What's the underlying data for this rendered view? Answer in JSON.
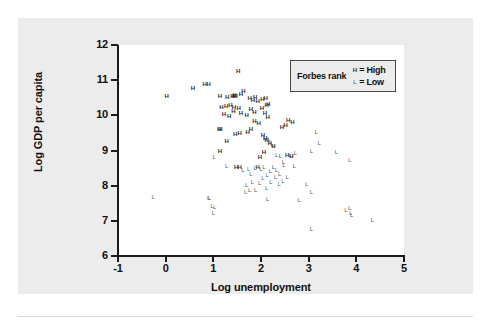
{
  "figure": {
    "background_color": "#ececec",
    "plot_background_color": "#ffffff",
    "axis_color": "#1b1b1b"
  },
  "legend": {
    "title": "Forbes rank",
    "entries": [
      {
        "marker": "H",
        "equals": "=",
        "label": "High",
        "key": "high"
      },
      {
        "marker": "L",
        "equals": "=",
        "label": "Low",
        "key": "low"
      }
    ]
  },
  "chart_data": {
    "type": "scatter",
    "title": "",
    "xlabel": "Log unemployment",
    "ylabel": "Log GDP per capita",
    "xlim": [
      -1,
      5
    ],
    "ylim": [
      6,
      12
    ],
    "xticks": [
      -1,
      0,
      1,
      2,
      3,
      4,
      5
    ],
    "yticks": [
      6,
      7,
      8,
      9,
      10,
      11,
      12
    ],
    "xtick_labels": [
      "-1",
      "0",
      "1",
      "2",
      "3",
      "4",
      "5"
    ],
    "ytick_labels": [
      "6",
      "7",
      "8",
      "9",
      "10",
      "11",
      "12"
    ],
    "grid": false,
    "legend_position": "top-right",
    "series": [
      {
        "name": "High",
        "marker": "H",
        "points": [
          [
            0.02,
            10.56
          ],
          [
            0.57,
            10.78
          ],
          [
            0.82,
            10.88
          ],
          [
            0.9,
            10.89
          ],
          [
            1.14,
            10.56
          ],
          [
            1.29,
            10.52
          ],
          [
            1.4,
            10.55
          ],
          [
            1.43,
            10.56
          ],
          [
            1.45,
            10.58
          ],
          [
            1.47,
            10.54
          ],
          [
            1.52,
            11.26
          ],
          [
            1.58,
            10.62
          ],
          [
            1.63,
            10.7
          ],
          [
            1.17,
            10.23
          ],
          [
            1.27,
            10.27
          ],
          [
            1.36,
            10.3
          ],
          [
            1.43,
            10.24
          ],
          [
            1.53,
            10.21
          ],
          [
            1.76,
            10.48
          ],
          [
            1.83,
            10.44
          ],
          [
            1.88,
            10.52
          ],
          [
            1.93,
            10.42
          ],
          [
            2.03,
            10.47
          ],
          [
            2.1,
            10.5
          ],
          [
            2.12,
            10.3
          ],
          [
            2.15,
            10.31
          ],
          [
            1.12,
            9.62
          ],
          [
            1.22,
            10.05
          ],
          [
            1.33,
            9.97
          ],
          [
            1.42,
            10.12
          ],
          [
            1.58,
            10.07
          ],
          [
            1.7,
            10.0
          ],
          [
            1.79,
            10.19
          ],
          [
            1.86,
            10.1
          ],
          [
            2.02,
            10.22
          ],
          [
            2.08,
            10.07
          ],
          [
            2.14,
            9.96
          ],
          [
            1.15,
            9.6
          ],
          [
            1.28,
            9.27
          ],
          [
            1.46,
            9.47
          ],
          [
            1.55,
            9.49
          ],
          [
            1.72,
            9.52
          ],
          [
            1.79,
            9.6
          ],
          [
            1.86,
            9.84
          ],
          [
            1.95,
            9.79
          ],
          [
            2.04,
            9.43
          ],
          [
            2.09,
            9.35
          ],
          [
            2.12,
            9.3
          ],
          [
            2.18,
            9.22
          ],
          [
            2.26,
            9.12
          ],
          [
            2.44,
            9.67
          ],
          [
            2.52,
            9.72
          ],
          [
            2.57,
            9.86
          ],
          [
            2.66,
            9.8
          ],
          [
            1.98,
            8.82
          ],
          [
            2.06,
            8.96
          ],
          [
            1.14,
            8.98
          ],
          [
            1.48,
            8.52
          ],
          [
            2.55,
            8.88
          ],
          [
            2.64,
            8.83
          ],
          [
            1.55,
            8.54
          ],
          [
            1.93,
            8.54
          ]
        ]
      },
      {
        "name": "Low",
        "marker": "L",
        "points": [
          [
            1.02,
            8.82
          ],
          [
            1.28,
            8.57
          ],
          [
            2.08,
            9.36
          ],
          [
            2.16,
            9.34
          ],
          [
            2.19,
            9.25
          ],
          [
            2.23,
            9.18
          ],
          [
            2.26,
            9.14
          ],
          [
            2.33,
            8.86
          ],
          [
            2.41,
            8.84
          ],
          [
            2.62,
            8.85
          ],
          [
            2.72,
            8.92
          ],
          [
            3.16,
            9.54
          ],
          [
            3.22,
            9.22
          ],
          [
            3.58,
            8.97
          ],
          [
            3.86,
            8.72
          ],
          [
            3.06,
            9.0
          ],
          [
            1.62,
            8.44
          ],
          [
            1.74,
            8.48
          ],
          [
            1.79,
            8.34
          ],
          [
            1.88,
            8.5
          ],
          [
            2.0,
            8.47
          ],
          [
            2.06,
            8.54
          ],
          [
            2.13,
            8.3
          ],
          [
            2.2,
            8.42
          ],
          [
            2.26,
            8.52
          ],
          [
            2.33,
            8.45
          ],
          [
            2.39,
            8.32
          ],
          [
            2.48,
            8.58
          ],
          [
            2.55,
            8.26
          ],
          [
            1.7,
            8.02
          ],
          [
            1.82,
            8.1
          ],
          [
            1.89,
            7.88
          ],
          [
            1.97,
            8.08
          ],
          [
            2.04,
            8.22
          ],
          [
            2.12,
            7.94
          ],
          [
            2.21,
            8.1
          ],
          [
            2.3,
            8.24
          ],
          [
            2.38,
            8.04
          ],
          [
            2.46,
            8.14
          ],
          [
            1.68,
            7.82
          ],
          [
            1.76,
            7.88
          ],
          [
            2.96,
            8.04
          ],
          [
            3.06,
            7.82
          ],
          [
            2.8,
            7.58
          ],
          [
            0.9,
            7.64
          ],
          [
            -0.26,
            7.68
          ],
          [
            0.92,
            7.66
          ],
          [
            0.97,
            7.42
          ],
          [
            1.03,
            7.38
          ],
          [
            1.0,
            7.22
          ],
          [
            3.06,
            6.76
          ],
          [
            3.78,
            7.32
          ],
          [
            3.86,
            7.36
          ],
          [
            3.88,
            7.22
          ],
          [
            3.9,
            7.16
          ],
          [
            4.34,
            7.02
          ],
          [
            2.7,
            8.56
          ],
          [
            2.14,
            7.62
          ],
          [
            2.47,
            8.66
          ]
        ]
      }
    ]
  }
}
